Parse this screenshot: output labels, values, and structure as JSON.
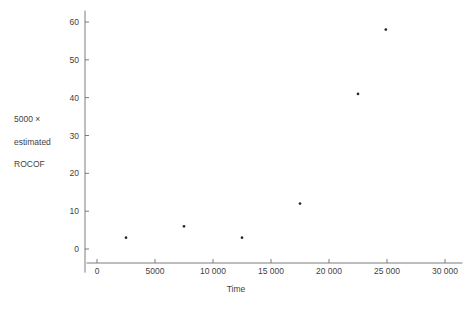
{
  "chart_data": {
    "type": "scatter",
    "title": "",
    "xlabel": "Time",
    "ylabel": "5000 ×\nestimated\nROCOF",
    "ylabel_lines": [
      "5000 ×",
      "estimated",
      "ROCOF"
    ],
    "x": [
      2500,
      7500,
      12500,
      17500,
      22500,
      24900
    ],
    "values": [
      3,
      6,
      3,
      12,
      41,
      58
    ],
    "points": [
      {
        "x": 2500,
        "y": 3
      },
      {
        "x": 7500,
        "y": 6
      },
      {
        "x": 12500,
        "y": 3
      },
      {
        "x": 17500,
        "y": 12
      },
      {
        "x": 22500,
        "y": 41
      },
      {
        "x": 24900,
        "y": 58
      }
    ],
    "xlim": [
      -900,
      31500
    ],
    "ylim": [
      -1.5,
      63
    ],
    "xticks": [
      0,
      5000,
      10000,
      15000,
      20000,
      25000,
      30000
    ],
    "xtick_labels": [
      "0",
      "5000",
      "10 000",
      "15 000",
      "20 000",
      "25 000",
      "30 000"
    ],
    "yticks": [
      0,
      10,
      20,
      30,
      40,
      50,
      60
    ],
    "ytick_labels": [
      "0",
      "10",
      "20",
      "30",
      "40",
      "50",
      "60"
    ],
    "grid": false,
    "legend": false,
    "marker_color": "#2a2a2a",
    "axis_color": "#6e6e6e",
    "background_color": "#ffffff"
  },
  "axis": {
    "x_title": "Time",
    "y_title_line1": "5000 ×",
    "y_title_line2": "estimated",
    "y_title_line3": "ROCOF"
  }
}
